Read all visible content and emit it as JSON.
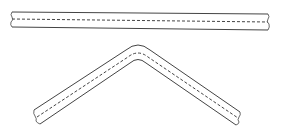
{
  "diagram": {
    "colors": {
      "stroke": "#444444",
      "background": "#ffffff"
    },
    "parts": [
      {
        "name": "straight-bar",
        "shape": "straight"
      },
      {
        "name": "bent-bar",
        "shape": "inverted-v"
      }
    ]
  }
}
